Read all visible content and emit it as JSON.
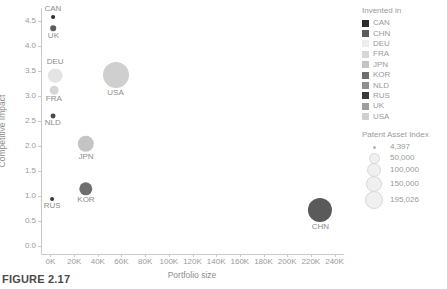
{
  "caption": "FIGURE 2.17",
  "chart_data": {
    "type": "scatter",
    "title": "",
    "xlabel": "Portfolio size",
    "ylabel": "Competitive Impact",
    "xlim": [
      -8000,
      248000
    ],
    "ylim": [
      -0.15,
      4.75
    ],
    "grid": false,
    "legend_position": "right",
    "xticks": [
      "0K",
      "20K",
      "40K",
      "60K",
      "80K",
      "100K",
      "120K",
      "140K",
      "160K",
      "180K",
      "200K",
      "220K",
      "240K"
    ],
    "xtick_values": [
      0,
      20000,
      40000,
      60000,
      80000,
      100000,
      120000,
      140000,
      160000,
      180000,
      200000,
      220000,
      240000
    ],
    "yticks": [
      "0.0",
      "0.5",
      "1.0",
      "1.5",
      "2.0",
      "2.5",
      "3.0",
      "3.5",
      "4.0",
      "4.5"
    ],
    "ytick_values": [
      0.0,
      0.5,
      1.0,
      1.5,
      2.0,
      2.5,
      3.0,
      3.5,
      4.0,
      4.5
    ],
    "size_key": "Patent Asset Index",
    "points": [
      {
        "label": "CAN",
        "x": 2000,
        "y": 4.57,
        "size": 4397,
        "color": "#2b2b2b",
        "label_pos": "top"
      },
      {
        "label": "UK",
        "x": 2500,
        "y": 4.35,
        "size": 9000,
        "color": "#5d5d5d",
        "label_pos": "bottom"
      },
      {
        "label": "DEU",
        "x": 4000,
        "y": 3.4,
        "size": 62000,
        "color": "#e4e4e4",
        "label_pos": "top"
      },
      {
        "label": "USA",
        "x": 55000,
        "y": 3.42,
        "size": 195026,
        "color": "#cfcfcf",
        "label_pos": "bottom"
      },
      {
        "label": "FRA",
        "x": 2800,
        "y": 3.12,
        "size": 22000,
        "color": "#d6d6d6",
        "label_pos": "bottom"
      },
      {
        "label": "NLD",
        "x": 2000,
        "y": 2.6,
        "size": 7000,
        "color": "#4a4a4a",
        "label_pos": "bottom"
      },
      {
        "label": "JPN",
        "x": 30000,
        "y": 2.05,
        "size": 78000,
        "color": "#c4c4c4",
        "label_pos": "bottom"
      },
      {
        "label": "KOR",
        "x": 30000,
        "y": 1.15,
        "size": 52000,
        "color": "#6e6e6e",
        "label_pos": "bottom"
      },
      {
        "label": "RUS",
        "x": 1500,
        "y": 0.95,
        "size": 4397,
        "color": "#3a3a3a",
        "label_pos": "bottom"
      },
      {
        "label": "CHN",
        "x": 228000,
        "y": 0.72,
        "size": 168000,
        "color": "#5a5a5a",
        "label_pos": "bottom"
      }
    ]
  },
  "legend": {
    "title": "Invented in",
    "items": [
      {
        "label": "CAN",
        "color": "#2b2b2b"
      },
      {
        "label": "CHN",
        "color": "#5a5a5a"
      },
      {
        "label": "DEU",
        "color": "#ededed"
      },
      {
        "label": "FRA",
        "color": "#d6d6d6"
      },
      {
        "label": "JPN",
        "color": "#c4c4c4"
      },
      {
        "label": "KOR",
        "color": "#6e6e6e"
      },
      {
        "label": "NLD",
        "color": "#8f8f8f"
      },
      {
        "label": "RUS",
        "color": "#3a3a3a"
      },
      {
        "label": "UK",
        "color": "#9d9d9d"
      },
      {
        "label": "USA",
        "color": "#cfcfcf"
      }
    ]
  },
  "size_legend": {
    "title": "Patent Asset Index",
    "items": [
      {
        "label": "4,397",
        "value": 4397,
        "d": 3
      },
      {
        "label": "50,000",
        "value": 50000,
        "d": 9
      },
      {
        "label": "100,000",
        "value": 100000,
        "d": 12
      },
      {
        "label": "150,000",
        "value": 150000,
        "d": 14
      },
      {
        "label": "195,026",
        "value": 195026,
        "d": 16
      }
    ]
  }
}
